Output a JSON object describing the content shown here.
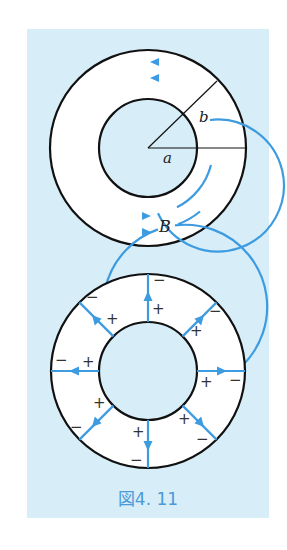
{
  "figure": {
    "caption": "図4. 11",
    "colors": {
      "panel_background": "#d7edf8",
      "annulus_fill": "#ffffff",
      "outline": "#111111",
      "field_line": "#3d9be0"
    },
    "top_diagram": {
      "description": "Coaxial annulus with circular magnetic field lines B",
      "labels": {
        "inner_radius": "a",
        "outer_radius": "b",
        "field": "B"
      }
    },
    "bottom_diagram": {
      "description": "Coaxial annulus with radial field lines from inner (+) to outer (-) conductor",
      "inner_sign": "+",
      "outer_sign": "−",
      "radial_line_count": 8
    }
  }
}
